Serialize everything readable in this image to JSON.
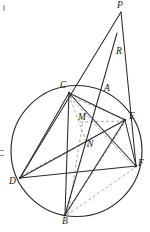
{
  "figure": {
    "width": 150,
    "height": 232,
    "background": "#ffffff",
    "stroke_color": "#2b2b2b",
    "dashed_color": "#9a9a9a",
    "circle": {
      "cx": 76.5,
      "cy": 151.0,
      "r": 65.5
    },
    "points": [
      {
        "id": "P",
        "label": "P",
        "x": 121,
        "y": 12,
        "label_x": 117,
        "label_y": 1,
        "dot": false
      },
      {
        "id": "R",
        "label": "R",
        "x": 113,
        "y": 58,
        "label_x": 116,
        "label_y": 47,
        "dot": false
      },
      {
        "id": "C",
        "label": "C",
        "x": 69,
        "y": 93,
        "label_x": 60,
        "label_y": 81,
        "dot": true
      },
      {
        "id": "A",
        "label": "A",
        "x": 101,
        "y": 100,
        "label_x": 104,
        "label_y": 84,
        "dot": false
      },
      {
        "id": "M",
        "label": "M",
        "x": 83,
        "y": 120,
        "label_x": 78,
        "label_y": 113,
        "dot": false
      },
      {
        "id": "E",
        "label": "E",
        "x": 125,
        "y": 120,
        "label_x": 129,
        "label_y": 112,
        "dot": true
      },
      {
        "id": "N",
        "label": "N",
        "x": 86,
        "y": 145,
        "label_x": 87,
        "label_y": 140,
        "dot": false
      },
      {
        "id": "D",
        "label": "D",
        "x": 20,
        "y": 178,
        "label_x": 9,
        "label_y": 177,
        "dot": true
      },
      {
        "id": "F",
        "label": "F",
        "x": 136,
        "y": 166,
        "label_x": 138,
        "label_y": 159,
        "dot": true
      },
      {
        "id": "B",
        "label": "B",
        "x": 65,
        "y": 215,
        "label_x": 62,
        "label_y": 217,
        "dot": true
      }
    ],
    "solid_segments": [
      {
        "name": "segment-P-D",
        "x1": 121,
        "y1": 12,
        "x2": 20,
        "y2": 178
      },
      {
        "name": "segment-P-F",
        "x1": 121,
        "y1": 12,
        "x2": 136,
        "y2": 166
      },
      {
        "name": "segment-R-B",
        "x1": 117,
        "y1": 33,
        "x2": 65,
        "y2": 215
      },
      {
        "name": "segment-C-E",
        "x1": 69,
        "y1": 93,
        "x2": 125,
        "y2": 120
      },
      {
        "name": "segment-C-F",
        "x1": 69,
        "y1": 93,
        "x2": 136,
        "y2": 166
      },
      {
        "name": "segment-C-B",
        "x1": 69,
        "y1": 93,
        "x2": 65,
        "y2": 215
      },
      {
        "name": "segment-C-D",
        "x1": 69,
        "y1": 93,
        "x2": 20,
        "y2": 178
      },
      {
        "name": "segment-D-E",
        "x1": 20,
        "y1": 178,
        "x2": 125,
        "y2": 120
      },
      {
        "name": "segment-D-F",
        "x1": 20,
        "y1": 178,
        "x2": 136,
        "y2": 166
      },
      {
        "name": "segment-E-B",
        "x1": 125,
        "y1": 120,
        "x2": 65,
        "y2": 215
      },
      {
        "name": "segment-E-F",
        "x1": 125,
        "y1": 120,
        "x2": 136,
        "y2": 166
      }
    ],
    "dashed_segments": [
      {
        "name": "dashed-C-A-E",
        "x1": 69,
        "y1": 96,
        "x2": 125,
        "y2": 119
      },
      {
        "name": "dashed-C-M-N",
        "x1": 69,
        "y1": 95,
        "x2": 88,
        "y2": 147
      },
      {
        "name": "dashed-M-E",
        "x1": 80,
        "y1": 122,
        "x2": 124,
        "y2": 121
      },
      {
        "name": "dashed-D-E",
        "x1": 21,
        "y1": 176,
        "x2": 124,
        "y2": 121
      },
      {
        "name": "dashed-B-E",
        "x1": 66,
        "y1": 214,
        "x2": 125,
        "y2": 122
      },
      {
        "name": "dashed-B-F",
        "x1": 67,
        "y1": 215,
        "x2": 136,
        "y2": 167
      },
      {
        "name": "dashed-B-M",
        "x1": 68,
        "y1": 214,
        "x2": 83,
        "y2": 121
      },
      {
        "name": "dashed-C-N-F",
        "x1": 70,
        "y1": 97,
        "x2": 135,
        "y2": 168
      }
    ],
    "artifacts": [
      {
        "name": "corner-mark-topleft",
        "description": "small faint tick at upper-left corner"
      },
      {
        "name": "edge-mark-left",
        "description": "small faint double tick at left edge"
      }
    ]
  }
}
